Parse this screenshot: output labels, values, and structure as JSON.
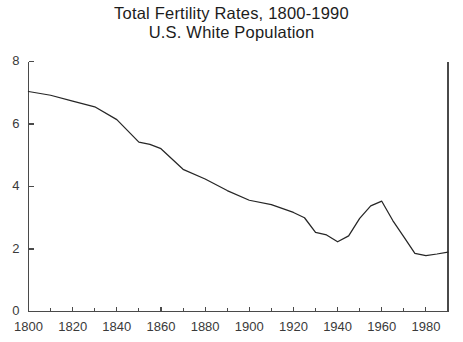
{
  "chart_data": {
    "type": "line",
    "title": "Total Fertility Rates, 1800-1990",
    "subtitle": "U.S. White Population",
    "title_line1": "Total Fertility Rates, 1800-1990",
    "title_line2": "U.S. White Population",
    "xlabel": "",
    "ylabel": "",
    "xlim": [
      1800,
      1990
    ],
    "ylim": [
      0,
      8
    ],
    "grid": false,
    "legend": null,
    "x_major_ticks": [
      1800,
      1820,
      1840,
      1860,
      1880,
      1900,
      1920,
      1940,
      1960,
      1980
    ],
    "x_minor_ticks": [
      1810,
      1830,
      1850,
      1870,
      1890,
      1910,
      1930,
      1950,
      1970,
      1990
    ],
    "x_tick_labels": [
      "1800",
      "1820",
      "1840",
      "1860",
      "1880",
      "1900",
      "1920",
      "1940",
      "1960",
      "1980"
    ],
    "y_ticks": [
      0,
      2,
      4,
      6,
      8
    ],
    "y_tick_labels": [
      "0",
      "2",
      "4",
      "6",
      "8"
    ],
    "series": [
      {
        "name": "Total Fertility Rate",
        "color": "#262626",
        "x": [
          1800,
          1810,
          1820,
          1830,
          1840,
          1850,
          1855,
          1860,
          1870,
          1880,
          1890,
          1900,
          1910,
          1920,
          1925,
          1930,
          1935,
          1940,
          1945,
          1950,
          1955,
          1960,
          1965,
          1970,
          1975,
          1980,
          1985,
          1990
        ],
        "y": [
          7.04,
          6.92,
          6.73,
          6.55,
          6.14,
          5.42,
          5.35,
          5.21,
          4.55,
          4.24,
          3.87,
          3.56,
          3.42,
          3.17,
          3.0,
          2.53,
          2.45,
          2.23,
          2.42,
          2.98,
          3.38,
          3.53,
          2.91,
          2.39,
          1.86,
          1.79,
          1.84,
          1.9
        ]
      }
    ]
  }
}
